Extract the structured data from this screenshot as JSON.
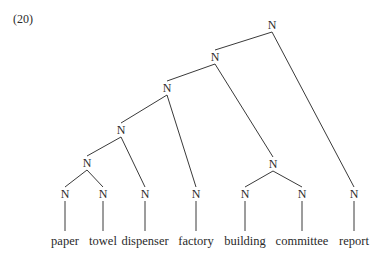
{
  "example_number": "(20)",
  "node_label": "N",
  "nodes": [
    {
      "id": "n1",
      "label": "N",
      "x": 272,
      "y": 25
    },
    {
      "id": "n2",
      "label": "N",
      "x": 215,
      "y": 57
    },
    {
      "id": "n3",
      "label": "N",
      "x": 167,
      "y": 88
    },
    {
      "id": "n4",
      "label": "N",
      "x": 121,
      "y": 130
    },
    {
      "id": "n5",
      "label": "N",
      "x": 87,
      "y": 163
    },
    {
      "id": "n6",
      "label": "N",
      "x": 273,
      "y": 164
    },
    {
      "id": "l1",
      "label": "N",
      "x": 65,
      "y": 194
    },
    {
      "id": "l2",
      "label": "N",
      "x": 103,
      "y": 194
    },
    {
      "id": "l3",
      "label": "N",
      "x": 145,
      "y": 194
    },
    {
      "id": "l4",
      "label": "N",
      "x": 196,
      "y": 194
    },
    {
      "id": "l5",
      "label": "N",
      "x": 245,
      "y": 194
    },
    {
      "id": "l6",
      "label": "N",
      "x": 302,
      "y": 194
    },
    {
      "id": "l7",
      "label": "N",
      "x": 354,
      "y": 194
    }
  ],
  "words": [
    {
      "text": "paper",
      "x": 65
    },
    {
      "text": "towel",
      "x": 103
    },
    {
      "text": "dispenser",
      "x": 145
    },
    {
      "text": "factory",
      "x": 196
    },
    {
      "text": "building",
      "x": 245
    },
    {
      "text": "committee",
      "x": 302
    },
    {
      "text": "report",
      "x": 354
    }
  ],
  "word_y": 241,
  "edges": [
    [
      "n1",
      "n2"
    ],
    [
      "n1",
      "l7"
    ],
    [
      "n2",
      "n3"
    ],
    [
      "n2",
      "n6"
    ],
    [
      "n3",
      "n4"
    ],
    [
      "n3",
      "l4"
    ],
    [
      "n4",
      "n5"
    ],
    [
      "n4",
      "l3"
    ],
    [
      "n5",
      "l1"
    ],
    [
      "n5",
      "l2"
    ],
    [
      "n6",
      "l5"
    ],
    [
      "n6",
      "l6"
    ]
  ]
}
